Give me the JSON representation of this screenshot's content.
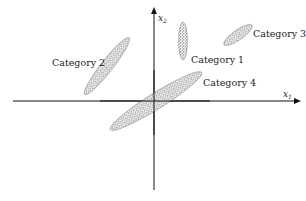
{
  "diagram": {
    "axes": {
      "x_label": "x",
      "x_sub": "1",
      "y_label": "x",
      "y_sub": "2"
    },
    "clusters": [
      {
        "name": "Category 1",
        "cx": 183,
        "cy": 41,
        "rx": 4.5,
        "ry": 19,
        "angle": 0
      },
      {
        "name": "Category 2",
        "cx": 107,
        "cy": 66,
        "rx": 36,
        "ry": 6,
        "angle": -52
      },
      {
        "name": "Category 3",
        "cx": 238,
        "cy": 35,
        "rx": 17,
        "ry": 5,
        "angle": -35
      },
      {
        "name": "Category 4",
        "cx": 156,
        "cy": 101,
        "rx": 54,
        "ry": 8,
        "angle": -32
      }
    ],
    "labels": [
      {
        "text": "Category 1",
        "x": 191,
        "y": 63
      },
      {
        "text": "Category 2",
        "x": 52,
        "y": 66
      },
      {
        "text": "Category 3",
        "x": 253,
        "y": 37
      },
      {
        "text": "Category 4",
        "x": 203,
        "y": 86
      }
    ],
    "colors": {
      "axis": "#111111",
      "dots": "#3a3a3a"
    }
  }
}
